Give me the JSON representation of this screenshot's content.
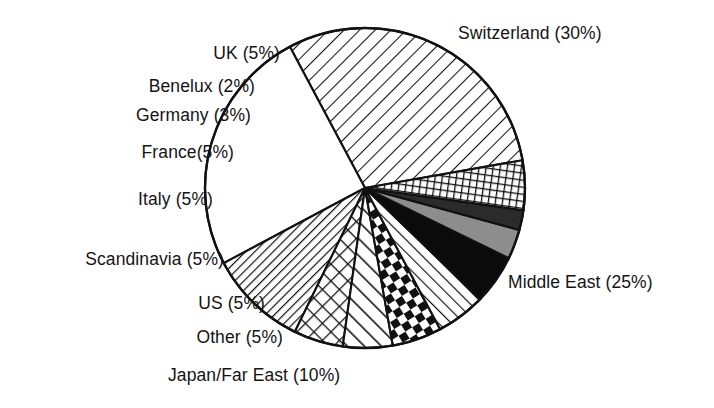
{
  "chart_data": {
    "type": "pie",
    "title": "",
    "subtitle": "",
    "xlabel": "",
    "ylabel": "",
    "units": "percent",
    "legend_position": "none",
    "labels_position": "outside-callout",
    "grid": false,
    "total": 100,
    "categories": [
      "Switzerland",
      "Middle East",
      "Japan/Far East",
      "Other",
      "US",
      "Scandinavia",
      "Italy",
      "France",
      "Germany",
      "Benelux",
      "UK"
    ],
    "values": [
      30,
      25,
      10,
      5,
      5,
      5,
      5,
      5,
      3,
      2,
      5
    ],
    "slices": [
      {
        "name": "Switzerland",
        "label": "Switzerland (30%)",
        "value": 30,
        "pattern": "diagonal-hatch-wide",
        "fill": "#ffffff",
        "ink": "#111111"
      },
      {
        "name": "Middle East",
        "label": "Middle East (25%)",
        "value": 25,
        "pattern": "solid-white",
        "fill": "#ffffff",
        "ink": "#111111"
      },
      {
        "name": "Japan/Far East",
        "label": "Japan/Far East (10%)",
        "value": 10,
        "pattern": "diagonal-hatch-dense",
        "fill": "#ffffff",
        "ink": "#111111"
      },
      {
        "name": "Other",
        "label": "Other (5%)",
        "value": 5,
        "pattern": "diamond-lattice",
        "fill": "#ffffff",
        "ink": "#111111"
      },
      {
        "name": "US",
        "label": "US (5%)",
        "value": 5,
        "pattern": "diagonal-stripe-wide",
        "fill": "#ffffff",
        "ink": "#111111"
      },
      {
        "name": "Scandinavia",
        "label": "Scandinavia (5%)",
        "value": 5,
        "pattern": "checkerboard",
        "fill": "#ffffff",
        "ink": "#111111"
      },
      {
        "name": "Italy",
        "label": "Italy (5%)",
        "value": 5,
        "pattern": "diagonal-hatch-medium",
        "fill": "#ffffff",
        "ink": "#111111"
      },
      {
        "name": "France",
        "label": "France(5%)",
        "value": 5,
        "pattern": "solid-black",
        "fill": "#0b0b0b",
        "ink": "#0b0b0b"
      },
      {
        "name": "Germany",
        "label": "Germany (3%)",
        "value": 3,
        "pattern": "solid-gray",
        "fill": "#8d8d8d",
        "ink": "#111111"
      },
      {
        "name": "Benelux",
        "label": "Benelux (2%)",
        "value": 2,
        "pattern": "solid-dark-gray",
        "fill": "#2b2b2b",
        "ink": "#111111"
      },
      {
        "name": "UK",
        "label": "UK (5%)",
        "value": 5,
        "pattern": "grid-crosshatch",
        "fill": "#ffffff",
        "ink": "#111111"
      }
    ],
    "geometry": {
      "center_x": 365,
      "center_y": 188,
      "radius": 160,
      "start_angle_deg": -10,
      "direction": "counterclockwise"
    },
    "colors": {
      "background": "#ffffff",
      "outline": "#111111",
      "text": "#141414"
    }
  },
  "labels": {
    "switzerland": "Switzerland (30%)",
    "uk": "UK (5%)",
    "benelux": "Benelux (2%)",
    "germany": "Germany (3%)",
    "france": "France(5%)",
    "italy": "Italy (5%)",
    "scandinavia": "Scandinavia (5%)",
    "us": "US (5%)",
    "other": "Other (5%)",
    "japan": "Japan/Far East (10%)",
    "middle_east": "Middle East (25%)"
  }
}
